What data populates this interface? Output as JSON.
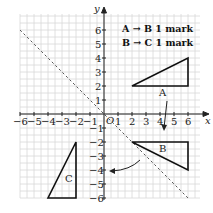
{
  "diagram": {
    "type": "coordinate-grid-transformations",
    "axes": {
      "x_label": "x",
      "y_label": "y",
      "origin_label": "O",
      "x_ticks": [
        "-6",
        "-5",
        "-4",
        "-3",
        "-2",
        "-1",
        "1",
        "2",
        "3",
        "4",
        "5",
        "6"
      ],
      "y_ticks": [
        "6",
        "5",
        "4",
        "3",
        "2",
        "1",
        "-1",
        "-2",
        "-3",
        "-4",
        "-5",
        "-6"
      ],
      "x_range": [
        -6,
        6
      ],
      "y_range": [
        -6,
        6
      ]
    },
    "legend": {
      "line1": "A → B 1 mark",
      "line2": "B → C 1 mark"
    },
    "mirror_line": {
      "equation": "y = -x",
      "style": "dashed"
    },
    "shapes": [
      {
        "label": "A",
        "vertices": [
          [
            2,
            2
          ],
          [
            6,
            2
          ],
          [
            6,
            4
          ]
        ]
      },
      {
        "label": "B",
        "vertices": [
          [
            2,
            -2
          ],
          [
            6,
            -2
          ],
          [
            6,
            -4
          ]
        ]
      },
      {
        "label": "C",
        "vertices": [
          [
            -2,
            -2
          ],
          [
            -2,
            -6
          ],
          [
            -4,
            -6
          ]
        ]
      }
    ],
    "arrows": [
      {
        "from": "A",
        "to": "B",
        "description": "reflection arrow downward"
      },
      {
        "from": "B",
        "to": "C",
        "description": "curved arrow toward y-axis"
      }
    ]
  }
}
